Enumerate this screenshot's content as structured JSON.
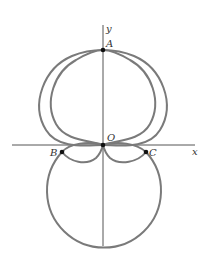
{
  "figure": {
    "axes": {
      "x_label": "x",
      "y_label": "y"
    },
    "points": {
      "A": "A",
      "B": "B",
      "C": "C",
      "O": "O"
    },
    "colors": {
      "curve": "#7a7a7a",
      "axis": "#555555",
      "point": "#111111"
    },
    "curves": [
      {
        "name": "outer-cardioid-loop",
        "description": "upper heart-shaped curve passing through A"
      },
      {
        "name": "inner-cardioid-loop",
        "description": "slightly narrower upper loop through A"
      },
      {
        "name": "lower-circle",
        "description": "circle below the x-axis passing through B and C"
      }
    ]
  }
}
